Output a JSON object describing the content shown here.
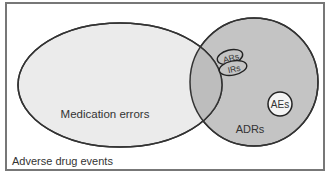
{
  "diagram": {
    "type": "venn",
    "outer_set": {
      "label": "Adverse drug events"
    },
    "sets": [
      {
        "id": "medication-errors",
        "label": "Medication errors",
        "fill": "#ebebeb"
      },
      {
        "id": "adrs",
        "label": "ADRs",
        "fill": "#c4c4c4"
      }
    ],
    "subsets": [
      {
        "id": "ars",
        "label": "ARs",
        "fill": "#c4c4c4"
      },
      {
        "id": "irs",
        "label": "IRs",
        "fill": "#c4c4c4"
      },
      {
        "id": "aes",
        "label": "AEs",
        "fill": "#f4f4f4"
      }
    ],
    "colors": {
      "stroke": "#333333",
      "frame": "#777777",
      "overlap": "#b8b8b8"
    }
  }
}
